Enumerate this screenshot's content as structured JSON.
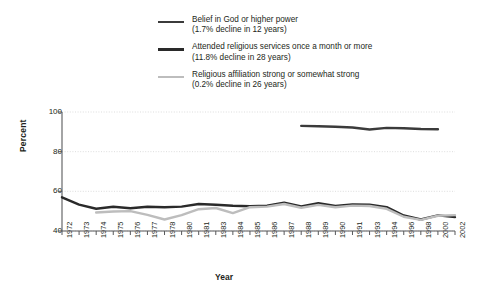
{
  "chart_data": {
    "type": "line",
    "title": "",
    "xlabel": "Year",
    "ylabel": "Percent",
    "ylim": [
      40,
      100
    ],
    "yticks": [
      40,
      60,
      80,
      100
    ],
    "grid": true,
    "legend_position": "top",
    "x": [
      1972,
      1973,
      1974,
      1975,
      1976,
      1977,
      1978,
      1980,
      1981,
      1983,
      1984,
      1985,
      1986,
      1987,
      1988,
      1989,
      1990,
      1991,
      1993,
      1994,
      1996,
      1998,
      2000,
      2002
    ],
    "series": [
      {
        "name": "Belief in God or higher power",
        "sublabel": "(1.7% decline in 12 years)",
        "color": "#3b3b3b",
        "width": 2.4,
        "x": [
          1988,
          1989,
          1990,
          1991,
          1993,
          1994,
          1996,
          1998,
          2000
        ],
        "values": [
          93.0,
          92.8,
          92.6,
          92.2,
          91.2,
          92.0,
          91.8,
          91.4,
          91.3
        ]
      },
      {
        "name": "Attended religious services once a month or more",
        "sublabel": "(11.8% decline in 28 years)",
        "color": "#2a2a2a",
        "width": 2.4,
        "x": [
          1972,
          1973,
          1974,
          1975,
          1976,
          1977,
          1978,
          1980,
          1981,
          1983,
          1984,
          1985,
          1986,
          1987,
          1988,
          1989,
          1990,
          1991,
          1993,
          1994,
          1996,
          1998,
          2000,
          2002
        ],
        "values": [
          57.0,
          53.3,
          51.2,
          52.2,
          51.5,
          52.2,
          52.0,
          52.3,
          53.6,
          53.2,
          52.7,
          52.5,
          52.8,
          54.3,
          52.4,
          54.0,
          52.6,
          53.4,
          53.3,
          52.0,
          47.8,
          45.8,
          47.9,
          47.0
        ]
      },
      {
        "name": "Religious affiliation strong or somewhat strong",
        "sublabel": "(0.2% decline in 26 years)",
        "color": "#bdbdbd",
        "width": 2.4,
        "x": [
          1974,
          1975,
          1976,
          1977,
          1978,
          1980,
          1981,
          1983,
          1984,
          1985,
          1986,
          1987,
          1988,
          1989,
          1990,
          1991,
          1993,
          1994,
          1996,
          1998,
          2000,
          2002
        ],
        "values": [
          49.3,
          49.8,
          50.0,
          48.1,
          45.8,
          48.0,
          51.0,
          51.6,
          49.0,
          52.0,
          52.3,
          53.6,
          51.7,
          53.2,
          52.0,
          52.8,
          52.6,
          51.2,
          47.2,
          45.6,
          47.7,
          48.0
        ]
      }
    ]
  },
  "legend": {
    "items": [
      {
        "label": "Belief in God or higher power",
        "sub": "(1.7% decline in 12 years)",
        "swatch": "legend-line-belief"
      },
      {
        "label": "Attended religious services once a month or more",
        "sub": "(11.8% decline in 28 years)",
        "swatch": "legend-line-attendance"
      },
      {
        "label": "Religious affiliation strong or somewhat strong",
        "sub": "(0.2% decline in 26 years)",
        "swatch": "legend-line-affiliation"
      }
    ]
  },
  "axes": {
    "ylabel": "Percent",
    "xlabel": "Year",
    "yticks": [
      "100",
      "80",
      "60",
      "40"
    ],
    "xticks": [
      "1972",
      "1973",
      "1974",
      "1975",
      "1976",
      "1977",
      "1978",
      "1980",
      "1981",
      "1983",
      "1984",
      "1985",
      "1986",
      "1987",
      "1988",
      "1989",
      "1990",
      "1991",
      "1993",
      "1994",
      "1996",
      "1998",
      "2000",
      "2002"
    ]
  },
  "colors": {
    "belief": "#3b3b3b",
    "attendance": "#2a2a2a",
    "affiliation": "#bdbdbd",
    "axis": "#58595b",
    "grid": "#d9d9d9",
    "text": "#231f20"
  }
}
